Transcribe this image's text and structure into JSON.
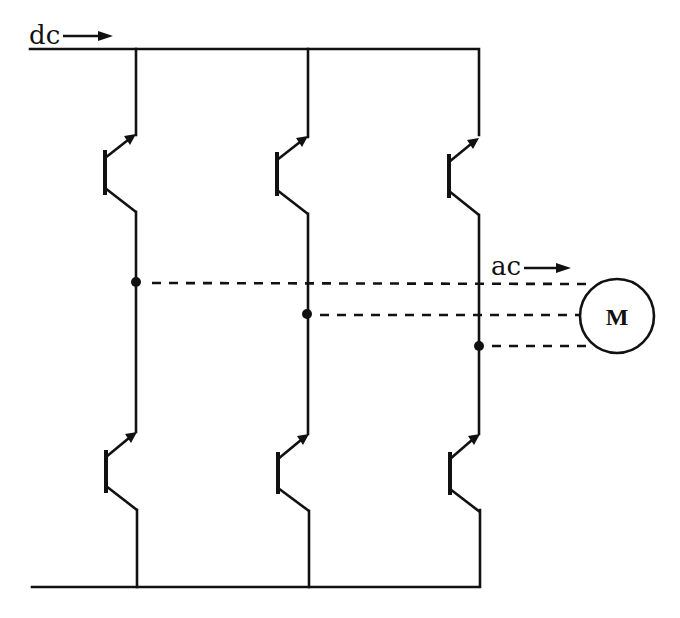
{
  "diagram": {
    "type": "three-phase transistor inverter circuit",
    "labels": {
      "input": "dc",
      "output": "ac",
      "motor": "M"
    },
    "rails": {
      "top": {
        "y": 49,
        "x_start": 30,
        "x_end": 479
      },
      "bottom": {
        "y": 587,
        "x_start": 32,
        "x_end": 480
      }
    },
    "legs": [
      {
        "name": "leg-1",
        "x": 136,
        "output_node_y": 282,
        "upper_transistor": {
          "base_x": 105,
          "top_y": 150,
          "bottom_y": 195
        },
        "lower_transistor": {
          "base_x": 106,
          "top_y": 450,
          "bottom_y": 493
        }
      },
      {
        "name": "leg-2",
        "x": 308,
        "output_node_y": 314,
        "upper_transistor": {
          "base_x": 277,
          "top_y": 152,
          "bottom_y": 196
        },
        "lower_transistor": {
          "base_x": 278,
          "top_y": 452,
          "bottom_y": 494
        }
      },
      {
        "name": "leg-3",
        "x": 479,
        "output_node_y": 346,
        "upper_transistor": {
          "base_x": 449,
          "top_y": 154,
          "bottom_y": 198
        },
        "lower_transistor": {
          "base_x": 450,
          "top_y": 452,
          "bottom_y": 495
        }
      }
    ],
    "motor": {
      "cx": 617,
      "cy": 316,
      "r": 37
    },
    "colors": {
      "ink": "#111111",
      "background": "#ffffff"
    }
  }
}
